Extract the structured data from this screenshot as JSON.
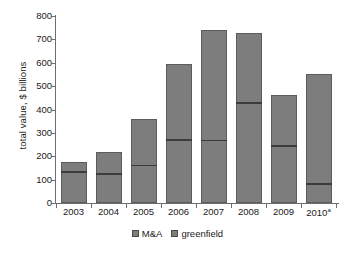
{
  "chart_data": {
    "type": "bar",
    "stacked": true,
    "title": "",
    "subtitle": "",
    "xlabel": "",
    "ylabel": "total value, $ billions",
    "categories": [
      "2003",
      "2004",
      "2005",
      "2006",
      "2007",
      "2008",
      "2009",
      "2010ᵃ"
    ],
    "category_labels_html": [
      "2003",
      "2004",
      "2005",
      "2006",
      "2007",
      "2008",
      "2009",
      "2010<sup>a</sup>"
    ],
    "series": [
      {
        "name": "M&A",
        "values": [
          137,
          128,
          163,
          274,
          270,
          432,
          247,
          85
        ]
      },
      {
        "name": "greenfield",
        "values": [
          38,
          90,
          196,
          321,
          470,
          296,
          213,
          468
        ]
      }
    ],
    "totals": [
      175,
      218,
      359,
      595,
      740,
      728,
      460,
      553
    ],
    "ylim": [
      0,
      800
    ],
    "yticks": [
      0,
      100,
      200,
      300,
      400,
      500,
      600,
      700,
      800
    ],
    "ytick_labels": [
      "0",
      "100",
      "200",
      "300",
      "400",
      "500",
      "600",
      "700",
      "800"
    ],
    "grid": false,
    "legend_position": "bottom",
    "colors": {
      "bar_fill": "#7d7d7d",
      "bar_stroke": "#5c5c5c",
      "divider": "#3b3b3b",
      "axis": "#6e6e6e",
      "text": "#1a1a1a",
      "background": "#ffffff"
    }
  },
  "legend": {
    "items": [
      {
        "label": "M&A"
      },
      {
        "label": "greenfield"
      }
    ]
  }
}
